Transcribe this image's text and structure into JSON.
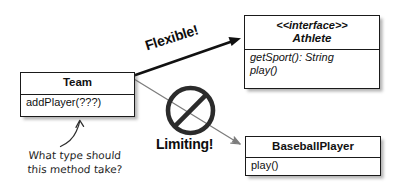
{
  "diagram": {
    "background_color": "#ffffff",
    "ink_color": "#111111",
    "arrow_flexible_color": "#111111",
    "arrow_limiting_color": "#7a7a7a"
  },
  "boxes": {
    "team": {
      "name": "Team",
      "members": [
        "addPlayer(???)"
      ]
    },
    "athlete": {
      "stereotype": "<<interface>>",
      "name": "Athlete",
      "members": [
        "getSport(): String",
        "play()"
      ]
    },
    "baseball_player": {
      "name": "BaseballPlayer",
      "members": [
        "play()"
      ]
    }
  },
  "annotations": {
    "flexible_label": "Flexible!",
    "limiting_label": "Limiting!",
    "note_line1": "What type should",
    "note_line2": "this method take?"
  },
  "icons": {
    "prohibition": "no-entry-icon",
    "note_arrow": "curved-arrow-icon",
    "flexible_arrow": "solid-arrow-icon",
    "limiting_arrow": "thin-arrow-icon"
  }
}
